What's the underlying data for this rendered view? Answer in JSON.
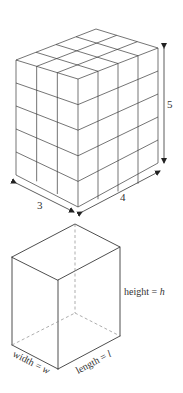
{
  "figure_top": {
    "description": "Rectangular prism made of unit cubes",
    "dimensions": {
      "width_cubes": 3,
      "length_cubes": 4,
      "height_cubes": 5
    },
    "labels": {
      "width": "3",
      "length": "4",
      "height": "5"
    }
  },
  "figure_bottom": {
    "description": "General rectangular prism with hidden edges dashed",
    "labels": {
      "height_word": "height = ",
      "height_var": "h",
      "width_word": "width = ",
      "width_var": "w",
      "length_word": "length = ",
      "length_var": "l"
    }
  },
  "colors": {
    "line": "#3a3a3a",
    "hidden_line": "#8a8a8a",
    "background": "#ffffff"
  }
}
